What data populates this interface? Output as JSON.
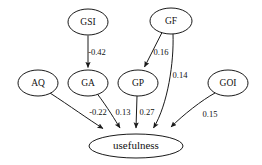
{
  "diagram": {
    "type": "path-diagram",
    "title": "",
    "canvas": {
      "width": 262,
      "height": 165
    },
    "nodes": [
      {
        "id": "GSI",
        "label": "GSI",
        "cx": 88,
        "cy": 22,
        "rx": 20,
        "ry": 13,
        "row": "top"
      },
      {
        "id": "GF",
        "label": "GF",
        "cx": 171,
        "cy": 21,
        "rx": 21,
        "ry": 13,
        "row": "top"
      },
      {
        "id": "AQ",
        "label": "AQ",
        "cx": 38,
        "cy": 83,
        "rx": 20,
        "ry": 13,
        "row": "middle"
      },
      {
        "id": "GA",
        "label": "GA",
        "cx": 88,
        "cy": 83,
        "rx": 20,
        "ry": 13,
        "row": "middle"
      },
      {
        "id": "GP",
        "label": "GP",
        "cx": 138,
        "cy": 83,
        "rx": 20,
        "ry": 13,
        "row": "middle"
      },
      {
        "id": "GOI",
        "label": "GOI",
        "cx": 228,
        "cy": 83,
        "rx": 20,
        "ry": 13,
        "row": "middle"
      },
      {
        "id": "usefulness",
        "label": "usefulness",
        "cx": 136,
        "cy": 146,
        "rx": 47,
        "ry": 12,
        "row": "outcome"
      }
    ],
    "edges": [
      {
        "id": "gsi-ga",
        "from": "GSI",
        "to": "GA",
        "coefficient": "-0.42",
        "label_x": 97,
        "label_y": 53
      },
      {
        "id": "gf-gp",
        "from": "GF",
        "to": "GP",
        "coefficient": "0.16",
        "label_x": 160,
        "label_y": 53
      },
      {
        "id": "gf-usefulness",
        "from": "GF",
        "to": "usefulness",
        "coefficient": "0.14",
        "label_x": 179,
        "label_y": 76
      },
      {
        "id": "aq-usefulness",
        "from": "AQ",
        "to": "usefulness",
        "coefficient": "-0.22",
        "label_x": 98,
        "label_y": 113
      },
      {
        "id": "ga-usefulness",
        "from": "GA",
        "to": "usefulness",
        "coefficient": "0.13",
        "label_x": 123,
        "label_y": 113
      },
      {
        "id": "gp-usefulness",
        "from": "GP",
        "to": "usefulness",
        "coefficient": "0.27",
        "label_x": 147,
        "label_y": 113
      },
      {
        "id": "goi-usefulness",
        "from": "GOI",
        "to": "usefulness",
        "coefficient": "0.15",
        "label_x": 209,
        "label_y": 115
      }
    ],
    "colors": {
      "stroke": "#1a1a1a",
      "node_fill": "#ffffff",
      "text": "#111111",
      "background": "#ffffff"
    }
  }
}
